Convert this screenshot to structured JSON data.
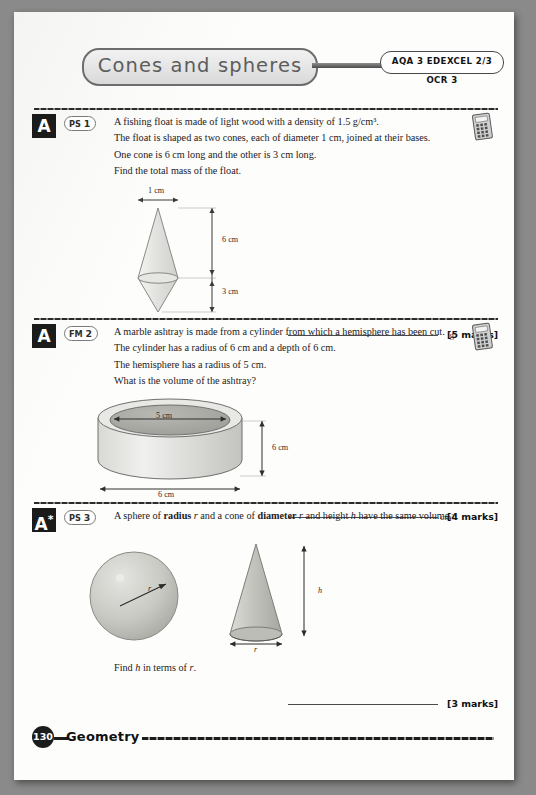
{
  "header": {
    "title": "Cones and spheres",
    "board_label": "AQA 3   EDEXCEL 2/3   OCR 3"
  },
  "questions": [
    {
      "grade": "A",
      "tag_prefix": "PS",
      "tag_number": "1",
      "lines": [
        "A fishing float is made of light wood with a density of 1.5 g/cm³.",
        "The float is shaped as two cones, each of diameter 1 cm, joined at their bases.",
        "One cone is 6 cm long and the other is 3 cm long.",
        "Find the total mass of the float."
      ],
      "has_calculator": true,
      "answer_unit": "g",
      "marks": "[5 marks]",
      "figure": {
        "type": "double-cone",
        "width_label": "1 cm",
        "upper_label": "6 cm",
        "lower_label": "3 cm"
      }
    },
    {
      "grade": "A",
      "tag_prefix": "FM",
      "tag_number": "2",
      "lines": [
        "A marble ashtray is made from a cylinder from which a hemisphere has been cut.",
        "The cylinder has a radius of 6 cm and a depth of 6 cm.",
        "The hemisphere has a radius of 5 cm.",
        "What is the volume of the ashtray?"
      ],
      "has_calculator": true,
      "answer_unit": "cm³",
      "marks": "[4 marks]",
      "figure": {
        "type": "cylinder-ashtray",
        "inner_label": "5 cm",
        "height_label": "6 cm",
        "base_label": "6 cm"
      }
    },
    {
      "grade": "A*",
      "tag_prefix": "PS",
      "tag_number": "3",
      "lines": [
        "A sphere of radius r and a cone of diameter r and height h have the same volume."
      ],
      "bold_words": [
        "radius",
        "diameter"
      ],
      "closing_line": "Find h in terms of r.",
      "has_calculator": false,
      "answer_unit": "",
      "marks": "[3 marks]",
      "figure": {
        "type": "sphere-and-cone",
        "sphere_radius_label": "r",
        "cone_height_label": "h",
        "cone_base_label": "r"
      }
    }
  ],
  "footer": {
    "page_number": "130",
    "section": "Geometry"
  }
}
